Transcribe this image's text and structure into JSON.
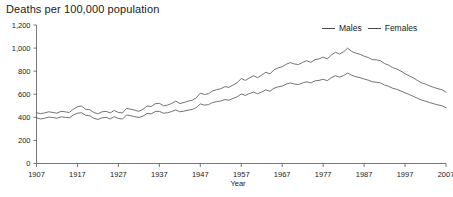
{
  "chart_data": {
    "type": "line",
    "title": "Deaths per 100,000 population",
    "xlabel": "Year",
    "ylabel": "",
    "xlim": [
      1907,
      2007
    ],
    "ylim": [
      0,
      1200
    ],
    "grid": false,
    "legend_position": "top-right",
    "ytick_labels": [
      "1,200",
      "1,000",
      "800",
      "600",
      "400",
      "200",
      "0"
    ],
    "ytick_values": [
      1200,
      1000,
      800,
      600,
      400,
      200,
      0
    ],
    "xtick_labels": [
      "1907",
      "1917",
      "1927",
      "1937",
      "1947",
      "1957",
      "1967",
      "1977",
      "1987",
      "1997",
      "2007"
    ],
    "xtick_values": [
      1907,
      1917,
      1927,
      1937,
      1947,
      1957,
      1967,
      1977,
      1987,
      1997,
      2007
    ],
    "x": [
      1907,
      1908,
      1909,
      1910,
      1911,
      1912,
      1913,
      1914,
      1915,
      1916,
      1917,
      1918,
      1919,
      1920,
      1921,
      1922,
      1923,
      1924,
      1925,
      1926,
      1927,
      1928,
      1929,
      1930,
      1931,
      1932,
      1933,
      1934,
      1935,
      1936,
      1937,
      1938,
      1939,
      1940,
      1941,
      1942,
      1943,
      1944,
      1945,
      1946,
      1947,
      1948,
      1949,
      1950,
      1951,
      1952,
      1953,
      1954,
      1955,
      1956,
      1957,
      1958,
      1959,
      1960,
      1961,
      1962,
      1963,
      1964,
      1965,
      1966,
      1967,
      1968,
      1969,
      1970,
      1971,
      1972,
      1973,
      1974,
      1975,
      1976,
      1977,
      1978,
      1979,
      1980,
      1981,
      1982,
      1983,
      1984,
      1985,
      1986,
      1987,
      1988,
      1989,
      1990,
      1991,
      1992,
      1993,
      1994,
      1995,
      1996,
      1997,
      1998,
      1999,
      2000,
      2001,
      2002,
      2003,
      2004,
      2005,
      2006,
      2007
    ],
    "series": [
      {
        "name": "Males",
        "color": "#5a5a5a",
        "values": [
          440,
          432,
          438,
          448,
          442,
          436,
          452,
          448,
          442,
          470,
          492,
          498,
          470,
          466,
          442,
          430,
          448,
          452,
          438,
          460,
          442,
          438,
          478,
          470,
          462,
          452,
          470,
          498,
          494,
          518,
          522,
          500,
          506,
          520,
          540,
          520,
          528,
          540,
          548,
          568,
          610,
          598,
          604,
          628,
          640,
          648,
          666,
          660,
          680,
          700,
          736,
          720,
          742,
          760,
          744,
          766,
          790,
          776,
          812,
          828,
          838,
          860,
          874,
          862,
          858,
          876,
          890,
          876,
          900,
          906,
          922,
          906,
          940,
          964,
          948,
          968,
          1000,
          970,
          956,
          946,
          930,
          918,
          900,
          898,
          890,
          866,
          852,
          830,
          818,
          800,
          778,
          760,
          742,
          720,
          700,
          688,
          672,
          660,
          648,
          640,
          618
        ]
      },
      {
        "name": "Females",
        "color": "#5a5a5a",
        "values": [
          396,
          386,
          392,
          402,
          398,
          392,
          404,
          400,
          396,
          420,
          436,
          440,
          418,
          414,
          392,
          382,
          396,
          400,
          386,
          406,
          390,
          386,
          420,
          414,
          406,
          398,
          410,
          434,
          430,
          450,
          452,
          436,
          440,
          450,
          464,
          448,
          454,
          462,
          468,
          484,
          516,
          506,
          510,
          528,
          536,
          542,
          554,
          548,
          564,
          578,
          602,
          590,
          606,
          618,
          604,
          620,
          638,
          626,
          652,
          664,
          670,
          688,
          698,
          688,
          684,
          698,
          708,
          698,
          716,
          720,
          730,
          718,
          744,
          760,
          748,
          762,
          784,
          764,
          752,
          744,
          732,
          722,
          708,
          704,
          698,
          680,
          668,
          652,
          642,
          628,
          612,
          598,
          582,
          566,
          550,
          540,
          528,
          518,
          508,
          500,
          484
        ]
      }
    ],
    "series_display": [
      {
        "name": "Males",
        "values": [
          440,
          432,
          438,
          448,
          442,
          436,
          452,
          448,
          442,
          470,
          492,
          498,
          470,
          466,
          442,
          430,
          448,
          452,
          438,
          460,
          442,
          438,
          478,
          470,
          462,
          452,
          470,
          498,
          494,
          518,
          522,
          500,
          506,
          520,
          540,
          520,
          528,
          540,
          548,
          568,
          610,
          598,
          604,
          628,
          640,
          648,
          666,
          660,
          680,
          700,
          736,
          720,
          742,
          760,
          744,
          766,
          790,
          776,
          812,
          828,
          838,
          860,
          874,
          862,
          858,
          876,
          890,
          876,
          900,
          906,
          922,
          906,
          940,
          964,
          948,
          968,
          1000,
          970,
          956,
          946,
          930,
          918,
          900,
          898,
          890,
          866,
          852,
          830,
          818,
          800,
          778,
          760,
          742,
          720,
          700,
          688,
          672,
          660,
          648,
          640,
          618
        ]
      }
    ],
    "annotations": [],
    "notes_peak_males": 1000,
    "notes_peak_males_year": 1983,
    "notes_end_males": 618,
    "notes_end_females": 484
  },
  "chart_render": {
    "comment": "rendered path geometry values",
    "males_label": "Males",
    "females_label": "Females"
  },
  "legend": {
    "items": [
      {
        "label": "Males"
      },
      {
        "label": "Females"
      }
    ]
  },
  "axis": {
    "xlabel": "Year",
    "title": "Deaths per 100,000 population"
  }
}
